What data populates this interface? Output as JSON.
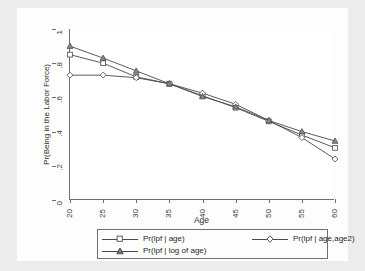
{
  "chart_data": {
    "type": "line",
    "title": "",
    "xlabel": "Age",
    "ylabel": "Pr(Being in the Labor Force)",
    "xlim": [
      20,
      60
    ],
    "ylim": [
      0,
      1
    ],
    "x": [
      20,
      25,
      30,
      35,
      40,
      45,
      50,
      55,
      60
    ],
    "xticks": [
      "20",
      "25",
      "30",
      "35",
      "40",
      "45",
      "50",
      "55",
      "60"
    ],
    "yticks": [
      "0",
      ".2",
      ".4",
      ".6",
      ".8",
      "1"
    ],
    "ytickvalues": [
      0,
      0.2,
      0.4,
      0.6,
      0.8,
      1
    ],
    "grid": false,
    "legend_position": "below",
    "series": [
      {
        "name": "Pr(lpf | age)",
        "marker": "square",
        "values": [
          0.85,
          0.8,
          0.72,
          0.68,
          0.61,
          0.54,
          0.46,
          0.38,
          0.305
        ]
      },
      {
        "name": "Pr(lpf | age,age2)",
        "marker": "diamond",
        "values": [
          0.73,
          0.73,
          0.715,
          0.68,
          0.625,
          0.56,
          0.465,
          0.365,
          0.24
        ]
      },
      {
        "name": "Pr(lpf | log of age)",
        "marker": "triangle",
        "values": [
          0.9,
          0.83,
          0.755,
          0.68,
          0.605,
          0.545,
          0.465,
          0.4,
          0.345
        ]
      }
    ],
    "line_color": "#4a4a4a",
    "marker_color": "#5a5a5a",
    "axis_color": "#6f6f6f",
    "background_color": "#ececec",
    "plot_background_color": "#ffffff"
  },
  "legend": {
    "items": [
      {
        "label": "Pr(lpf | age)",
        "marker": "square-marker-icon"
      },
      {
        "label": "Pr(lpf | age,age2)",
        "marker": "diamond-marker-icon"
      },
      {
        "label": "Pr(lpf | log of age)",
        "marker": "triangle-marker-icon"
      }
    ]
  }
}
